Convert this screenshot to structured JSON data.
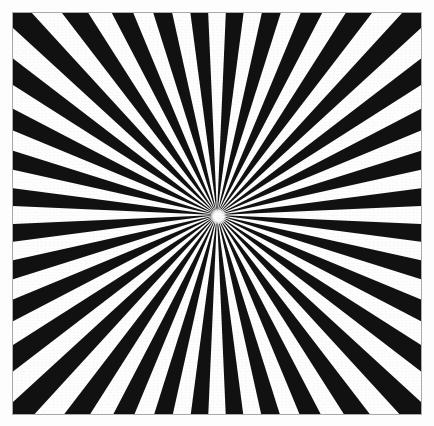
{
  "image": {
    "title": "Radial starburst pattern",
    "description": "High-contrast black and white radial sunburst (starburst) optical pattern of alternating wedges converging on a single off-centre vanishing point, enclosed in a thin rectangular frame.",
    "width": 434,
    "height": 426,
    "background_color": "#fdfdfd"
  },
  "frame": {
    "name": "artwork-frame",
    "x": 12,
    "y": 12,
    "width": 410,
    "height": 403,
    "border_color": "#a9a9a9",
    "border_width": 1,
    "fill_color": "#ffffff"
  },
  "pattern": {
    "type": "radial-starburst",
    "ray_color": "#111111",
    "gap_color": "#ffffff",
    "wedge_count": 36,
    "segment_count": 72,
    "angular_period_deg": 10,
    "duty_cycle": 0.5,
    "phase_offset_deg": 2.5,
    "ray_length": 760,
    "center": {
      "x": 216,
      "y": 214,
      "x_rel_frame": 204,
      "y_rel_frame": 202
    },
    "center_bloom": {
      "diameter": 17,
      "color": "#ffffff"
    }
  },
  "chart_data": {
    "type": "pie",
    "subtitle": "",
    "xlabel": "",
    "ylabel": "",
    "legend_position": "none",
    "grid": false,
    "categories": [
      "black wedge",
      "white gap"
    ],
    "values": [
      50,
      50
    ],
    "colors": [
      "#111111",
      "#ffffff"
    ],
    "slice_count": 72,
    "slice_angle_deg": 5,
    "annotations": []
  }
}
